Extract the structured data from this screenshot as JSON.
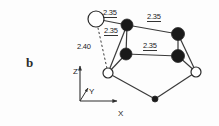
{
  "figure": {
    "panel_label": "b",
    "type": "molecular-structure-diagram",
    "background": "#fdfdfd",
    "line_color": "#3a3a3a",
    "filled_atom_color": "#1a1a1a",
    "open_atom_color": "#ffffff"
  },
  "bond_labels": [
    {
      "id": "top-left",
      "text": "2.35",
      "x": 103,
      "y": 9,
      "underlined": true
    },
    {
      "id": "top-right",
      "text": "2.35",
      "x": 147,
      "y": 13,
      "underlined": true
    },
    {
      "id": "inner",
      "text": "2.35",
      "x": 104,
      "y": 27,
      "underlined": true
    },
    {
      "id": "middle",
      "text": "2.35",
      "x": 143,
      "y": 42,
      "underlined": true
    },
    {
      "id": "dashed-long",
      "text": "2.40",
      "x": 77,
      "y": 43,
      "underlined": false
    }
  ],
  "axes": {
    "z": {
      "label": "Z",
      "x": 73,
      "y": 68
    },
    "y": {
      "label": "Y",
      "x": 89,
      "y": 88
    },
    "x": {
      "label": "X",
      "x": 118,
      "y": 110
    },
    "origin": {
      "x": 80,
      "y": 101
    }
  },
  "atoms": [
    {
      "id": "a1",
      "kind": "open",
      "cx": 96,
      "cy": 19,
      "r": 8.0
    },
    {
      "id": "a2",
      "kind": "filled",
      "cx": 127,
      "cy": 25,
      "r": 6.0
    },
    {
      "id": "a3",
      "kind": "filled",
      "cx": 178,
      "cy": 34,
      "r": 6.5
    },
    {
      "id": "a4",
      "kind": "filled",
      "cx": 126,
      "cy": 54,
      "r": 6.0
    },
    {
      "id": "a5",
      "kind": "filled",
      "cx": 178,
      "cy": 56,
      "r": 6.5
    },
    {
      "id": "a6",
      "kind": "open",
      "cx": 108,
      "cy": 73,
      "r": 5.0
    },
    {
      "id": "a7",
      "kind": "open",
      "cx": 196,
      "cy": 72,
      "r": 5.0
    },
    {
      "id": "a8",
      "kind": "filled",
      "cx": 155,
      "cy": 99,
      "r": 3.0
    }
  ],
  "bonds": [
    {
      "from": "a1",
      "to": "a2",
      "style": "solid"
    },
    {
      "from": "a2",
      "to": "a3",
      "style": "solid"
    },
    {
      "from": "a2",
      "to": "a6",
      "style": "solid"
    },
    {
      "from": "a2",
      "to": "a4",
      "style": "solid"
    },
    {
      "from": "a4",
      "to": "a5",
      "style": "solid"
    },
    {
      "from": "a4",
      "to": "a6",
      "style": "solid"
    },
    {
      "from": "a3",
      "to": "a5",
      "style": "solid"
    },
    {
      "from": "a3",
      "to": "a7",
      "style": "solid"
    },
    {
      "from": "a5",
      "to": "a7",
      "style": "solid"
    },
    {
      "from": "a6",
      "to": "a8",
      "style": "solid"
    },
    {
      "from": "a8",
      "to": "a7",
      "style": "solid"
    },
    {
      "from": "a1",
      "to": "a6",
      "style": "dashed"
    }
  ]
}
